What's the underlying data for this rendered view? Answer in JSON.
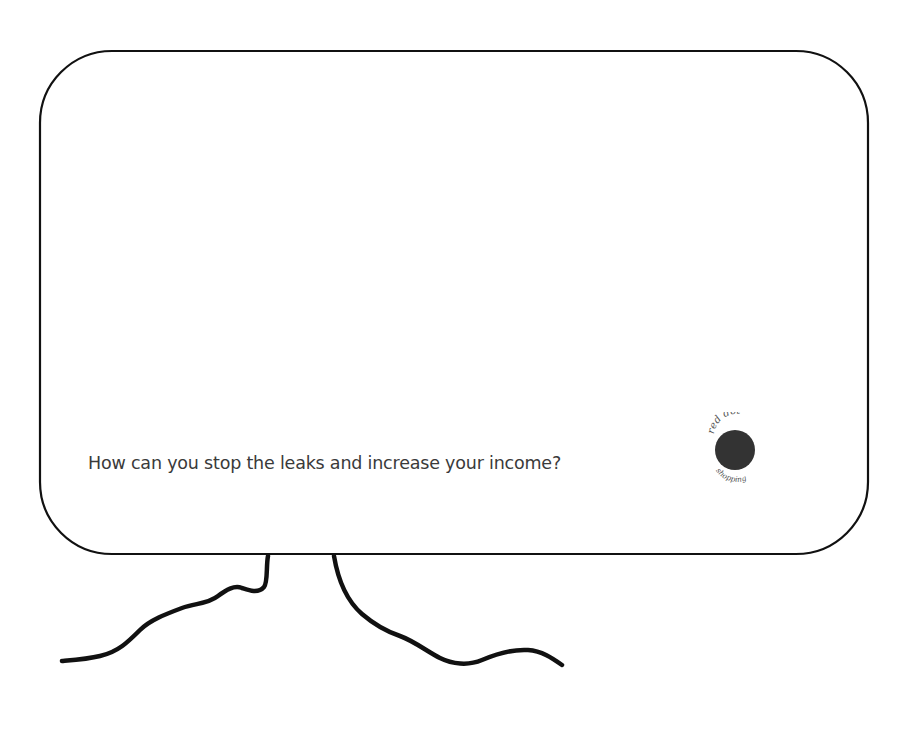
{
  "slide": {
    "caption": "How can you stop the leaks and increase your income?",
    "colors": {
      "background": "#ffffff",
      "outline": "#111111",
      "caption": "#3a3a3a",
      "logo_dot": "#333333",
      "logo_text": "#555555"
    }
  },
  "logo": {
    "top_text": "red dot",
    "bottom_text": "shopping",
    "icon": "red-dot-icon"
  }
}
